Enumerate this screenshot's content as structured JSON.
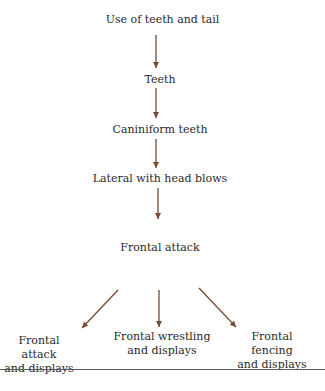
{
  "diagram": {
    "nodes": [
      {
        "id": "n1",
        "label": "Use of teeth and tail"
      },
      {
        "id": "n2",
        "label": "Teeth"
      },
      {
        "id": "n3",
        "label": "Caniniform teeth"
      },
      {
        "id": "n4",
        "label": "Lateral with head blows"
      },
      {
        "id": "n5",
        "label": "Frontal attack"
      },
      {
        "id": "n6",
        "line1": "Frontal attack",
        "line2": "and displays"
      },
      {
        "id": "n7",
        "line1": "Frontal wrestling",
        "line2": "and displays"
      },
      {
        "id": "n8",
        "line1": "Frontal fencing",
        "line2": "and displays"
      }
    ],
    "edges": [
      {
        "from": "n1",
        "to": "n2"
      },
      {
        "from": "n2",
        "to": "n3"
      },
      {
        "from": "n3",
        "to": "n4"
      },
      {
        "from": "n4",
        "to": "n5"
      },
      {
        "from": "n5",
        "to": "n6"
      },
      {
        "from": "n5",
        "to": "n7"
      },
      {
        "from": "n5",
        "to": "n8"
      }
    ],
    "arrow_color": "#7a4a30",
    "rule_color": "#555b5a"
  }
}
